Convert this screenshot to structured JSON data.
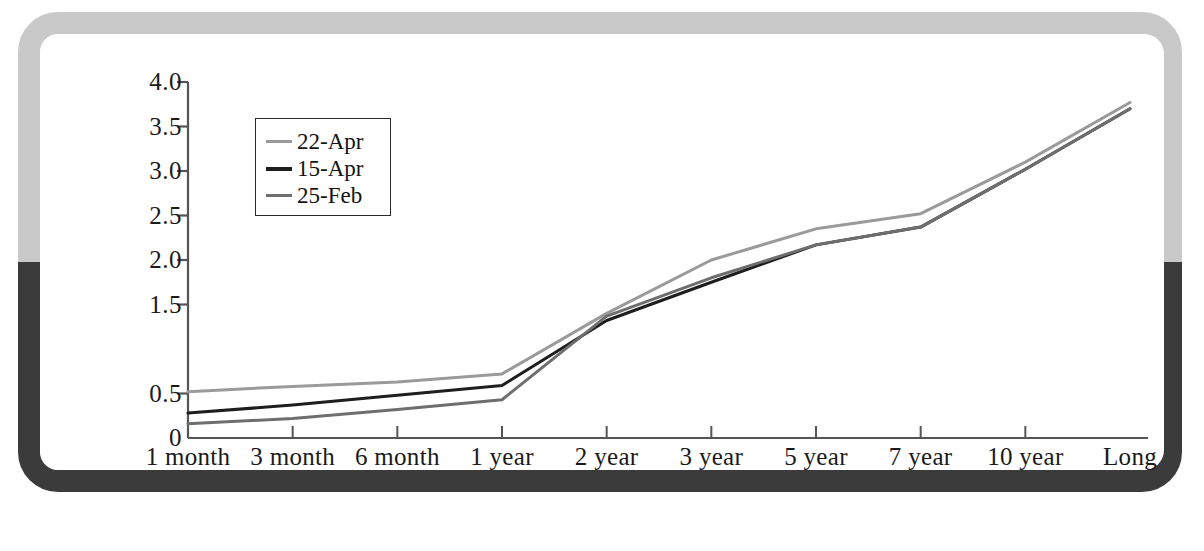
{
  "frame": {
    "top_color": "#c9c9c9",
    "bottom_color": "#3b3b3b",
    "card_color": "#ffffff"
  },
  "chart_data": {
    "type": "line",
    "title": "",
    "subtitle": "",
    "xlabel": "",
    "ylabel": "",
    "grid": false,
    "legend_position": "upper-left-inside",
    "categories": [
      "1 month",
      "3 month",
      "6 month",
      "1 year",
      "2 year",
      "3 year",
      "5 year",
      "7 year",
      "10 year",
      "Long"
    ],
    "ytick_labels": [
      "4.0",
      "3.5",
      "3.0",
      "2.5",
      "2.0",
      "1.5",
      "0.5",
      "0"
    ],
    "ytick_values": [
      4.0,
      3.5,
      3.0,
      2.5,
      2.0,
      1.5,
      0.5,
      0.0
    ],
    "ylim": [
      0.0,
      4.0
    ],
    "axis_color": "#555555",
    "series": [
      {
        "name": "22-Apr",
        "color": "#9a9a9a",
        "width": 3.0,
        "values": [
          0.52,
          0.58,
          0.63,
          0.72,
          1.4,
          2.0,
          2.35,
          2.52,
          3.1,
          3.77
        ]
      },
      {
        "name": "15-Apr",
        "color": "#1e1e1e",
        "width": 3.0,
        "values": [
          0.28,
          0.37,
          0.48,
          0.59,
          1.32,
          1.75,
          2.17,
          2.37,
          3.02,
          3.7
        ]
      },
      {
        "name": "25-Feb",
        "color": "#6e6e6e",
        "width": 3.0,
        "values": [
          0.16,
          0.22,
          0.32,
          0.43,
          1.37,
          1.8,
          2.17,
          2.37,
          3.02,
          3.7
        ]
      }
    ]
  }
}
